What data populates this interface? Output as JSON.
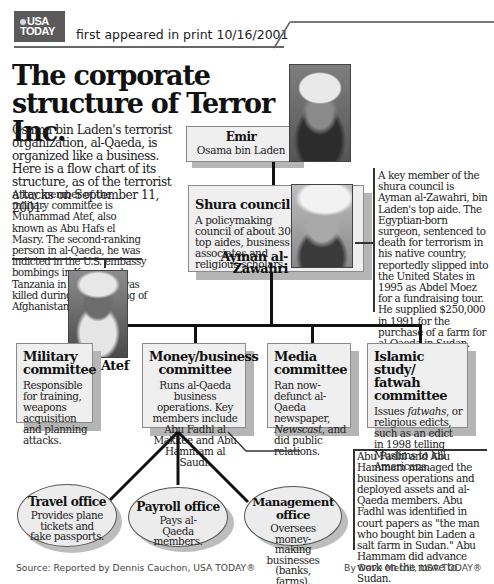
{
  "header": {
    "logo_line1": "USA",
    "logo_line2": "TODAY",
    "print_note": "first appeared in print 10/16/2001"
  },
  "title": "The corporate structure of Terror Inc.",
  "intro": "Osama bin Laden's terrorist organization, al-Qaeda, is organized like a business. Here is a flow chart of its structure, as of the terrorist attacks on September 11, 2001:",
  "notes": {
    "atef": "A key member of the military committee is Muhammad Atef, also known as Abu Hafs el Masry. The second-ranking person in al-Qaeda, he was indicted in the U.S. embassy bombings in Kenya and Tanzania in 1998. Atef was killed during the bombing of Afghanistan.",
    "zawahri": "A key member of the shura council is Ayman al-Zawahri, bin Laden's top aide. The Egyptian-born surgeon, sentenced to death for terrorism in his native country, reportedly slipped into the United States in 1995 as Abdel Moez for a fundraising tour. He supplied $250,000 in 1991 for the purchase of a farm for al-Qaeda in Sudan.",
    "money": "Abu Fadhl and Abu Hammam managed the business operations and deployed assets and al-Qaeda members. Abu Fadhl was identified in court papers as \"the man who bought bin Laden a salt farm in Sudan.\" Abu Hammam did advance work on the move to Sudan."
  },
  "chart": {
    "emir": {
      "title": "Emir",
      "name": "Osama bin Laden"
    },
    "shura": {
      "title": "Shura council",
      "body": "A policymaking council of about 30 top aides, business associates and religious scholars.",
      "person": "Ayman al-Zawahri"
    },
    "committees": [
      {
        "title": "Military committee",
        "body": "Responsible for training, weapons acquisition and planning attacks.",
        "person": "Atef"
      },
      {
        "title": "Money/business committee",
        "body": "Runs al-Qaeda business operations. Key members include Abu Fadhl al Makkee and Abu Hammam al Saudi."
      },
      {
        "title": "Media committee",
        "body_pre": "Ran now-defunct al-Qaeda newspaper, ",
        "body_italic": "Newscast",
        "body_post": ", and did public relations."
      },
      {
        "title": "Islamic study/ fatwah committee",
        "body_pre": "Issues ",
        "body_italic": "fatwahs",
        "body_post": ", or religious edicts, such as an edict in 1998 telling Muslims to kill Americans."
      }
    ],
    "offices": [
      {
        "title": "Travel office",
        "body": "Provides plane tickets and fake passports."
      },
      {
        "title": "Payroll office",
        "body": "Pays al-Qaeda members."
      },
      {
        "title": "Management office",
        "body": "Oversees money-making businesses (banks, farms)."
      }
    ]
  },
  "footer": {
    "source": "Source: Reported by Dennis Cauchon, USA TODAY®",
    "byline": "By Dave Merrill, USA TODAY®"
  }
}
